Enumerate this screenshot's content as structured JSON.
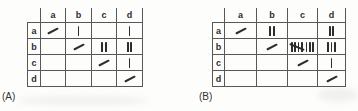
{
  "figure": {
    "background": "#fdfdfc",
    "ink_color": "#2d2d2d",
    "grid_line_color": "#575757",
    "description_marks": {
      "diagonal_cell_mark": "slash",
      "count_mark": "tally"
    }
  },
  "tables": [
    {
      "caption": "(A)",
      "col_headers": [
        "a",
        "b",
        "c",
        "d"
      ],
      "row_headers": [
        "a",
        "b",
        "c",
        "d"
      ],
      "cells": [
        [
          "/",
          1,
          0,
          1
        ],
        [
          0,
          "/",
          2,
          2
        ],
        [
          0,
          0,
          "/",
          1
        ],
        [
          0,
          0,
          0,
          "/"
        ]
      ]
    },
    {
      "caption": "(B)",
      "col_headers": [
        "a",
        "b",
        "c",
        "d"
      ],
      "row_headers": [
        "a",
        "b",
        "c",
        "d"
      ],
      "cells": [
        [
          "/",
          2,
          0,
          2
        ],
        [
          0,
          "/",
          8,
          3
        ],
        [
          0,
          0,
          "/",
          1
        ],
        [
          0,
          0,
          0,
          "/"
        ]
      ]
    }
  ]
}
